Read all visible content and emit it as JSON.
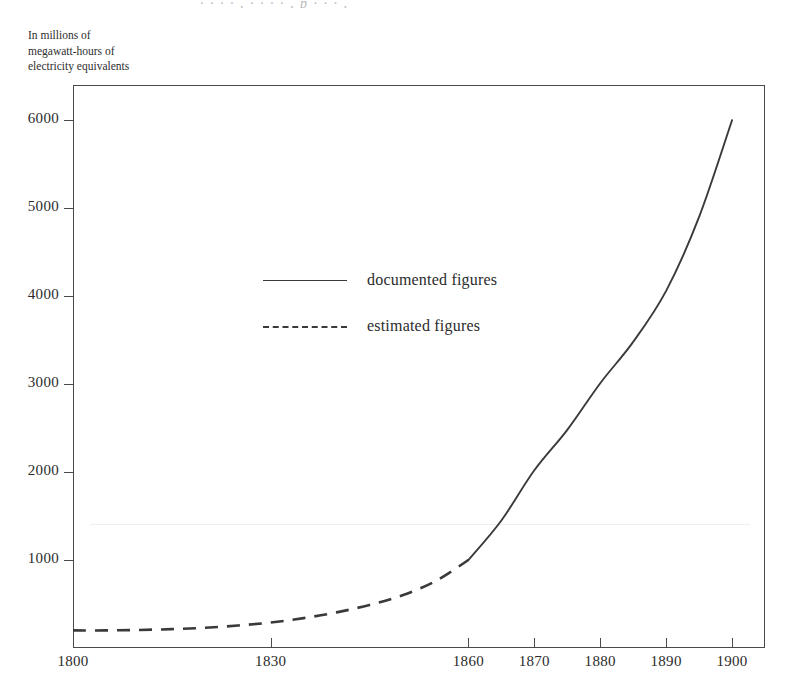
{
  "figure": {
    "top_caption_fragment": "· · · · , · · · · , p · · · ,",
    "y_axis_caption": "In millions of\nmegawatt-hours of\nelectricity equivalents"
  },
  "legend": {
    "position": "inside-upper-left",
    "entries": [
      {
        "label": "documented figures",
        "style": "solid",
        "swatch_name": "legend-swatch-solid"
      },
      {
        "label": "estimated figures",
        "style": "dashed",
        "swatch_name": "legend-swatch-dashed"
      }
    ]
  },
  "chart_data": {
    "type": "line",
    "title": "",
    "subtitle": "",
    "xlabel": "",
    "ylabel": "In millions of megawatt-hours of electricity equivalents",
    "xlim": [
      1800,
      1905
    ],
    "ylim": [
      0,
      6400
    ],
    "grid": false,
    "x_ticks": [
      1800,
      1830,
      1860,
      1870,
      1880,
      1890,
      1900
    ],
    "x_tick_labels": [
      "1800",
      "1830",
      "1860",
      "1870",
      "1880",
      "1890",
      "1900"
    ],
    "y_ticks": [
      1000,
      2000,
      3000,
      4000,
      5000,
      6000
    ],
    "y_tick_labels": [
      "1000",
      "2000",
      "3000",
      "4000",
      "5000",
      "6000"
    ],
    "series": [
      {
        "name": "estimated figures",
        "style": "dashed",
        "color": "#3a3a3a",
        "x": [
          1800,
          1805,
          1810,
          1815,
          1820,
          1825,
          1830,
          1835,
          1840,
          1845,
          1850,
          1855,
          1860
        ],
        "values": [
          200,
          200,
          205,
          215,
          230,
          255,
          290,
          340,
          405,
          490,
          600,
          760,
          1000
        ]
      },
      {
        "name": "documented figures",
        "style": "solid",
        "color": "#3a3a3a",
        "x": [
          1860,
          1865,
          1870,
          1875,
          1880,
          1885,
          1890,
          1895,
          1900
        ],
        "values": [
          1000,
          1450,
          2020,
          2480,
          3010,
          3480,
          4060,
          4900,
          6000
        ]
      }
    ],
    "annotations": []
  },
  "colors": {
    "line": "#3a3a3a",
    "axis": "#4a4a4a",
    "text": "#2b2b2b",
    "background": "#ffffff"
  }
}
